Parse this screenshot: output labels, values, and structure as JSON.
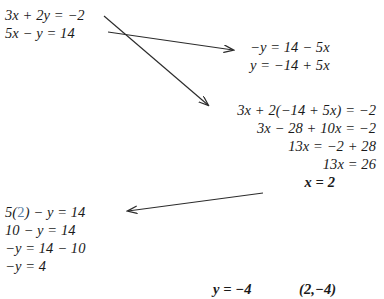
{
  "document": {
    "title": "Solving a system of linear equations by substitution",
    "background_color": "#ffffff",
    "text_color": "#1a1a1a",
    "highlight_color": "#5b7fa6"
  },
  "system": {
    "equation_1": "3x + 2y = −2",
    "equation_2": "5x − y = 14"
  },
  "isolate_step": {
    "line_1": "−y = 14 − 5x",
    "line_2": "y = −14 + 5x"
  },
  "substitute_step": {
    "line_1": "3x + 2(−14 + 5x) = −2",
    "line_2": "3x − 28 + 10x = −2",
    "line_3": "13x = −2 + 28",
    "line_4": "13x = 26",
    "line_5": "x = 2"
  },
  "back_substitute_step": {
    "line_1_prefix": "5(",
    "line_1_value": "2",
    "line_1_suffix": ") − y = 14",
    "line_2": "10 − y = 14",
    "line_3": "−y = 14 − 10",
    "line_4": "−y = 4"
  },
  "solution": {
    "y_value": "y = −4",
    "ordered_pair": "(2,−4)"
  },
  "arrows": [
    {
      "name": "arrow-to-isolate",
      "from": [
        108,
        32
      ],
      "to": [
        236,
        50
      ]
    },
    {
      "name": "arrow-to-substitute",
      "from": [
        104,
        16
      ],
      "to": [
        211,
        108
      ]
    },
    {
      "name": "arrow-to-back-substitute",
      "from": [
        263,
        193
      ],
      "to": [
        124,
        212
      ]
    }
  ]
}
